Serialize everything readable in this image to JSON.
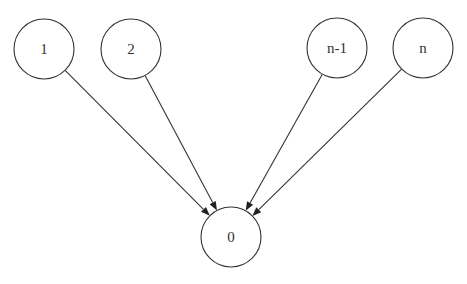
{
  "diagram": {
    "type": "directed-graph",
    "nodes": [
      {
        "id": "1",
        "label": "1"
      },
      {
        "id": "2",
        "label": "2"
      },
      {
        "id": "n-1",
        "label": "n-1"
      },
      {
        "id": "n",
        "label": "n"
      },
      {
        "id": "0",
        "label": "0"
      }
    ],
    "edges": [
      {
        "from": "1",
        "to": "0"
      },
      {
        "from": "2",
        "to": "0"
      },
      {
        "from": "n-1",
        "to": "0"
      },
      {
        "from": "n",
        "to": "0"
      }
    ]
  }
}
